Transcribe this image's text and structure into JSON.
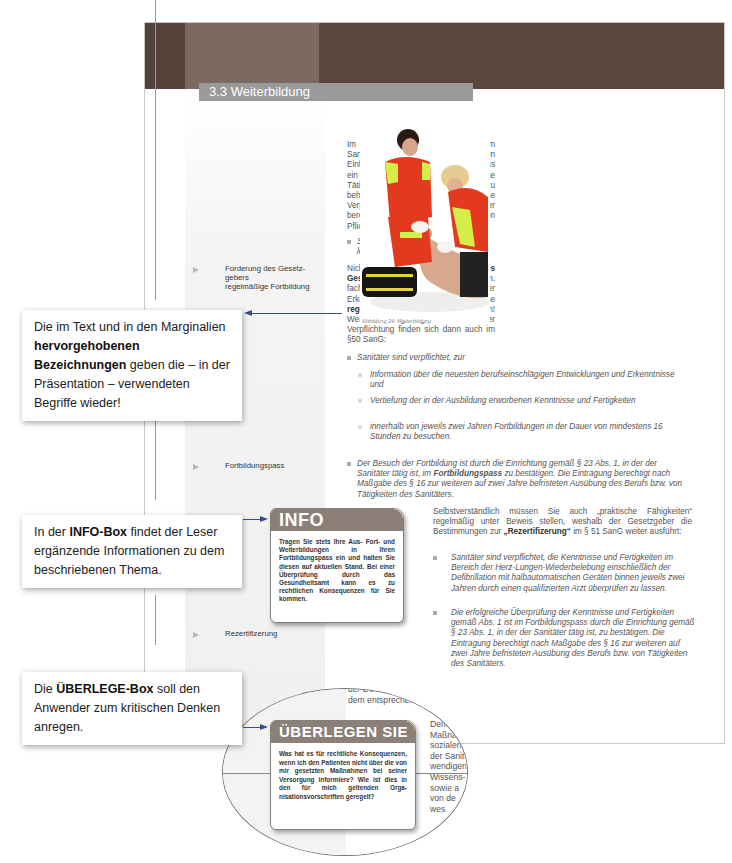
{
  "section": {
    "title": "3.3 Weiterbildung"
  },
  "paragraphs": {
    "intro": "Im Gegensatz zu den Zeiten vor dem Sanitätergesetz ist seit dessen Einführung nun auch klar geregelt, was ein Sanitäter tun muss, um seine Tätigkeits- bzw. Berufsberechtigung zu behalten. Angesprochen ist diese Verpflichtung im § 4 (2) SanG, der bereits zu Beginn bei den allgemeinen Pflichten angesprochen worden ist:",
    "intro_bullet": "Sanitäter haben sich tätigkeitsre­levant fortzubilden.",
    "p2_a": "Nicht zuletzt die ",
    "p2_bold1": "Forderung des Gesetzgebers",
    "p2_b": ", die Tätigkeit gem. fachlicher und wissenschaftlicher Erkenntnisse auszuüben, macht eine ",
    "p2_bold2": "regelmäßige Fortbildung",
    "p2_c": " unerlässlich! Weitere Regelungen zu dieser Verpflichtung finden sich dann auch im §50 SanG:",
    "p2_bullet": "Sanitäter sind verpflichtet, zur",
    "sub_bullets": [
      "Information über die neuesten berufseinschlägigen Entwicklungen und Erkenntnisse und",
      "Vertiefung der in der Ausbildung erworbenen Kenntnisse und Fertig­keiten",
      "innerhalb von jeweils zwei Jahren Fortbildungen in der Dauer von minde­stens 16 Stunden zu besuchen."
    ],
    "pass_a": "Der Besuch der Fortbildung ist durch die Einrichtung gemäß § 23 Abs. 1, in der der Sanitäter tätig ist, im ",
    "pass_bold": "Fortbildungspass",
    "pass_b": " zu bestätigen. Die Eintra­gung berechtigt nach Maßgabe des § 16 zur weiteren auf zwei Jahre befri­steten Ausübung des Berufs bzw. von Tätigkeiten des Sanitäters.",
    "rez_a": "Selbstverständlich müssen Sie auch „praktische Fähig­keiten“ regelmäßig unter Beweis stellen, weshalb der Gesetzgeber die Bestimmungen zur ",
    "rez_bold": "„Rezertifizerung“",
    "rez_b": " im § 51 SanG weiter ausführt:",
    "rez_bullets": [
      "Sanitäter sind verpflichtet, die Kenntnisse und Fer­tigkeiten im Bereich der Herz-Lungen-Wiederbele­bung einschließlich der Defibrillation mit halbauto­matischen Geräten binnen jeweils zwei Jahren durch einen qualifizierten Arzt überprüfen zu lassen.",
      "Die erfolgreiche Überprüfung der Kenntnisse und Fertigkeiten gemäß Abs. 1 ist im Fortbildungspass durch die Einrichtung gemäß § 23 Abs. 1, in der der Sanitäter tätig ist, zu bestätigen. Die Eintragung berechtigt nach Maßgabe des § 16 zur weiteren auf zwei Jahre befristeten Ausübung des Berufs bzw. von Tätigkeiten des Sanitäters."
    ],
    "cut_left": [
      "der Dokum",
      "dem entsprechen"
    ],
    "cut_right": [
      "Dem",
      "Maßna",
      "sozialen",
      "der Sanit",
      "wendigen",
      "Wissens-",
      "sowie a",
      "von de",
      "wes"
    ]
  },
  "marginals": [
    {
      "label": "Forderung des Gesetz­gebers\nregelmäßige Fort­bildung"
    },
    {
      "label": "Fortbildungspass"
    },
    {
      "label": "Rezertifizerung"
    }
  ],
  "figure": {
    "caption": "Abbildung 24: Weiterbildung"
  },
  "info_box": {
    "title": "INFO",
    "text": "Tragen Sie stets Ihre Aus- Fort- und Weiterbildungen in Ihren Fortbildungs­pass ein und halten Sie diesen auf aktuellen Stand. Bei einer Überprüfung durch das Gesundheitsamt kann es zu rechtlichen Konsequenzen für Sie kommen."
  },
  "ueberlegen_box": {
    "title": "ÜBERLEGEN SIE",
    "text": "Was hat es für rechtliche Konsequen­zen, wenn ich den Patienten nicht über die von mir gesetzten Maßnahmen bei seiner Versorgung informiere? Wie ist dies in den für mich geltenden Orga­nisationsvorschriften geregelt?"
  },
  "callouts": {
    "c1_a": "Die im Text und in den Mar­ginalien ",
    "c1_bold": "hervorgehobenen Bezeichnungen",
    "c1_b": " geben die – in der Präsentation – verwendeten Begriffe wieder!",
    "c2_a": "In der ",
    "c2_bold": "INFO-Box",
    "c2_b": " findet der Le­ser ergänzende Informationen zu dem beschriebenen Thema.",
    "c3_a": "Die ",
    "c3_bold": "ÜBERLEGE-Box",
    "c3_b": " soll den Anwender zum kritischen Den­ken anregen."
  },
  "colors": {
    "header_dark": "#5a463c",
    "header_light": "#7c6a60",
    "section_bar": "#9a9a9a",
    "box_header": "#8b7f77",
    "arrow": "#3b4a8a"
  }
}
